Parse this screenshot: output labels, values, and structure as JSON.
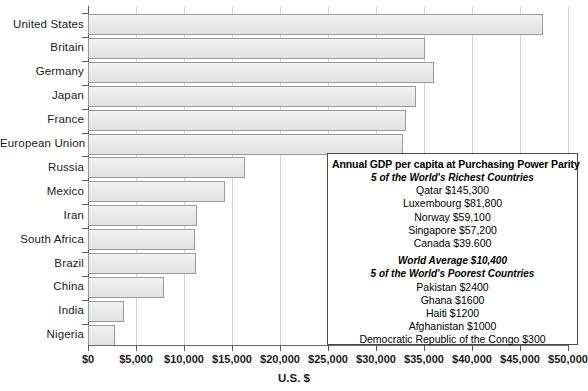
{
  "chart_data": {
    "type": "bar",
    "orientation": "horizontal",
    "title": "",
    "xlabel": "U.S. $",
    "ylabel": "",
    "xlim": [
      0,
      50000
    ],
    "grid": true,
    "categories": [
      "United States",
      "Britain",
      "Germany",
      "Japan",
      "France",
      "European Union",
      "Russia",
      "Mexico",
      "Iran",
      "South Africa",
      "Brazil",
      "China",
      "India",
      "Nigeria"
    ],
    "values": [
      47400,
      35100,
      36000,
      34200,
      33100,
      32800,
      16400,
      14300,
      11400,
      11100,
      11300,
      7900,
      3700,
      2800
    ],
    "xticks": [
      0,
      5000,
      10000,
      15000,
      20000,
      25000,
      30000,
      35000,
      40000,
      45000,
      50000
    ],
    "xticklabels": [
      "$0",
      "$5,000",
      "$10,000",
      "$15,000",
      "$20,000",
      "$25,000",
      "$30,000",
      "$35,000",
      "$40,000",
      "$45,000",
      "$50,000"
    ],
    "bar_fill": "#ebebeb",
    "bar_edge": "#9a9a9a",
    "grid_color": "#d2d2d2",
    "axis_color": "#5a5a5a"
  },
  "legend": {
    "title": "Annual GDP per capita at Purchasing Power Parity",
    "richest_heading": "5 of the World's Richest Countries",
    "richest": [
      "Qatar $145,300",
      "Luxembourg $81,800",
      "Norway $59,100",
      "Singapore $57,200",
      "Canada $39.600"
    ],
    "world_average": "World Average $10,400",
    "poorest_heading": "5 of the World's Poorest Countries",
    "poorest": [
      "Pakistan $2400",
      "Ghana $1600",
      "Haiti $1200",
      "Afghanistan $1000",
      "Democratic Republic of the Congo $300"
    ]
  }
}
